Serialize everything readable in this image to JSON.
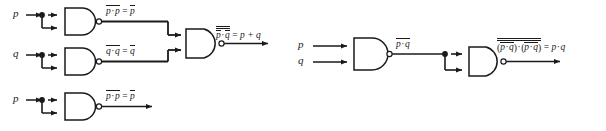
{
  "figure": {
    "type": "logic-circuit-diagram",
    "stroke_color": "#1a1a1a",
    "background_color": "#ffffff",
    "gate_fill": "#ffffff"
  },
  "left_circuit": {
    "name": "or-from-nand",
    "inputs": [
      {
        "label": "p",
        "name": "input-p"
      },
      {
        "label": "q",
        "name": "input-q"
      }
    ],
    "gates": [
      {
        "name": "nand-gate-p",
        "type": "NAND",
        "inputs": [
          "p",
          "p"
        ],
        "output_label_parts": {
          "lhs_a": "p",
          "lhs_b": "p",
          "rhs": "p"
        }
      },
      {
        "name": "nand-gate-q",
        "type": "NAND",
        "inputs": [
          "q",
          "q"
        ],
        "output_label_parts": {
          "lhs_a": "q",
          "lhs_b": "q",
          "rhs": "q"
        }
      },
      {
        "name": "nand-gate-out",
        "type": "NAND",
        "inputs": [
          "p-bar",
          "q-bar"
        ],
        "output_label_parts": {
          "lhs_a": "p",
          "lhs_b": "q",
          "rhs": "p + q"
        }
      }
    ],
    "labels": {
      "gate1_output": "p · p = p",
      "gate2_output": "q · q = q",
      "gate3_output": "p · q = p + q"
    }
  },
  "left_circuit_bottom": {
    "name": "not-from-nand",
    "inputs": [
      {
        "label": "p",
        "name": "input-p"
      }
    ],
    "gates": [
      {
        "name": "nand-gate-inverter",
        "type": "NAND",
        "inputs": [
          "p",
          "p"
        ]
      }
    ],
    "labels": {
      "gate_output": "p · p = p"
    }
  },
  "right_circuit": {
    "name": "and-from-nand",
    "inputs": [
      {
        "label": "p",
        "name": "input-p"
      },
      {
        "label": "q",
        "name": "input-q"
      }
    ],
    "gates": [
      {
        "name": "nand-gate-pq",
        "type": "NAND",
        "inputs": [
          "p",
          "q"
        ]
      },
      {
        "name": "nand-gate-inverter",
        "type": "NAND",
        "inputs": [
          "pq-bar",
          "pq-bar"
        ]
      }
    ],
    "labels": {
      "gate1_output": "p · q",
      "gate2_output": "(p · q) · (p · q) = p · q"
    }
  },
  "symbols": {
    "p": "p",
    "q": "q",
    "dot": "·",
    "equals": "=",
    "plus": "+",
    "lparen": "(",
    "rparen": ")",
    "plus_expr": "p + q"
  }
}
